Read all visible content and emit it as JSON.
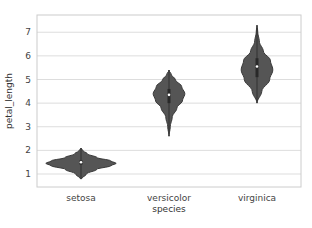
{
  "chart_data": {
    "type": "violin",
    "title": "",
    "xlabel": "species",
    "ylabel": "petal_length",
    "categories": [
      "setosa",
      "versicolor",
      "virginica"
    ],
    "ylim": [
      0.45,
      7.73
    ],
    "yticks": [
      1,
      2,
      3,
      4,
      5,
      6,
      7
    ],
    "grid": true,
    "fill_color": "#555555",
    "series": [
      {
        "name": "setosa",
        "min": 0.8,
        "max": 2.1,
        "q1": 1.4,
        "median": 1.5,
        "q3": 1.58,
        "density": [
          [
            0.8,
            0.02
          ],
          [
            1.0,
            0.15
          ],
          [
            1.2,
            0.45
          ],
          [
            1.35,
            0.85
          ],
          [
            1.45,
            1.0
          ],
          [
            1.55,
            0.85
          ],
          [
            1.7,
            0.45
          ],
          [
            1.85,
            0.18
          ],
          [
            2.0,
            0.05
          ],
          [
            2.1,
            0.0
          ]
        ]
      },
      {
        "name": "versicolor",
        "min": 2.6,
        "max": 5.4,
        "q1": 4.0,
        "median": 4.35,
        "q3": 4.6,
        "density": [
          [
            2.6,
            0.0
          ],
          [
            3.0,
            0.08
          ],
          [
            3.4,
            0.2
          ],
          [
            3.8,
            0.5
          ],
          [
            4.1,
            0.85
          ],
          [
            4.4,
            1.0
          ],
          [
            4.7,
            0.8
          ],
          [
            5.0,
            0.4
          ],
          [
            5.2,
            0.15
          ],
          [
            5.4,
            0.0
          ]
        ]
      },
      {
        "name": "virginica",
        "min": 4.0,
        "max": 7.3,
        "q1": 5.1,
        "median": 5.55,
        "q3": 5.9,
        "density": [
          [
            4.0,
            0.0
          ],
          [
            4.5,
            0.3
          ],
          [
            5.0,
            0.8
          ],
          [
            5.4,
            1.0
          ],
          [
            5.8,
            0.85
          ],
          [
            6.2,
            0.4
          ],
          [
            6.6,
            0.15
          ],
          [
            7.0,
            0.05
          ],
          [
            7.3,
            0.0
          ]
        ]
      }
    ]
  }
}
